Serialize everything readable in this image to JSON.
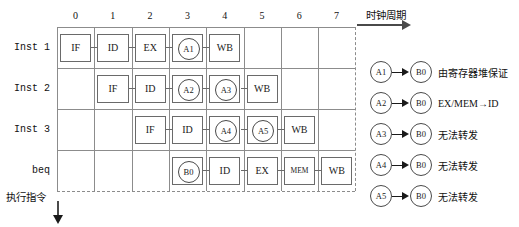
{
  "axes": {
    "x_caption": "时钟周期",
    "y_caption": "执行指令",
    "columns": [
      "0",
      "1",
      "2",
      "3",
      "4",
      "5",
      "6",
      "7"
    ]
  },
  "rows": [
    {
      "label": "Inst 1",
      "stages": [
        {
          "text": "IF",
          "col": 0
        },
        {
          "text": "ID",
          "col": 1
        },
        {
          "text": "EX",
          "col": 2
        },
        {
          "text": "MEM",
          "col": 3
        },
        {
          "text": "WB",
          "col": 4
        }
      ],
      "markers": [
        {
          "text": "A1",
          "col": 3.5
        }
      ]
    },
    {
      "label": "Inst 2",
      "stages": [
        {
          "text": "IF",
          "col": 1
        },
        {
          "text": "ID",
          "col": 2
        },
        {
          "text": "EX",
          "col": 3
        },
        {
          "text": "MEM",
          "col": 4
        },
        {
          "text": "WB",
          "col": 5
        }
      ],
      "markers": [
        {
          "text": "A2",
          "col": 3.5
        },
        {
          "text": "A3",
          "col": 4.5
        }
      ]
    },
    {
      "label": "Inst 3",
      "stages": [
        {
          "text": "IF",
          "col": 2
        },
        {
          "text": "ID",
          "col": 3
        },
        {
          "text": "EX",
          "col": 4
        },
        {
          "text": "MEM",
          "col": 5
        },
        {
          "text": "WB",
          "col": 6
        }
      ],
      "markers": [
        {
          "text": "A4",
          "col": 4.5
        },
        {
          "text": "A5",
          "col": 5.5
        }
      ]
    },
    {
      "label": "beq",
      "stages": [
        {
          "text": "IF",
          "col": 3
        },
        {
          "text": "ID",
          "col": 4
        },
        {
          "text": "EX",
          "col": 5
        },
        {
          "text": "MEM",
          "col": 6
        },
        {
          "text": "WB",
          "col": 7
        }
      ],
      "markers": [
        {
          "text": "B0",
          "col": 3.5
        }
      ]
    }
  ],
  "legend": [
    {
      "from": "A1",
      "to": "B0",
      "note": "由寄存器堆保证"
    },
    {
      "from": "A2",
      "to": "B0",
      "note": "EX/MEM→ID"
    },
    {
      "from": "A3",
      "to": "B0",
      "note": "无法转发"
    },
    {
      "from": "A4",
      "to": "B0",
      "note": "无法转发"
    },
    {
      "from": "A5",
      "to": "B0",
      "note": "无法转发"
    }
  ],
  "colors": {
    "grid": "#8c8c8c",
    "box_border": "#6a6a6a",
    "circle_border": "#4a4a4a",
    "text": "#1a1a1a",
    "background": "#ffffff"
  }
}
